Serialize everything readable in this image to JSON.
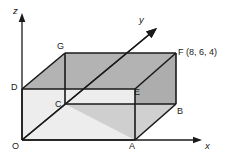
{
  "figure": {
    "background_color": "#ffffff",
    "line_color": "#1a1a1a",
    "axes": {
      "x_label": "x",
      "y_label": "y",
      "z_label": "z",
      "origin_label": "O"
    },
    "vertices": [
      {
        "key": "O",
        "label": "O",
        "coords": null
      },
      {
        "key": "A",
        "label": "A",
        "coords": null
      },
      {
        "key": "B",
        "label": "B",
        "coords": null
      },
      {
        "key": "C",
        "label": "C",
        "coords": null
      },
      {
        "key": "D",
        "label": "D",
        "coords": null
      },
      {
        "key": "E",
        "label": "E",
        "coords": null
      },
      {
        "key": "G",
        "label": "G",
        "coords": null
      },
      {
        "key": "F",
        "label": "F (8, 6, 4)",
        "coords": "(8, 6, 4)"
      }
    ],
    "faces": {
      "front_color": "#ededed",
      "top_color": "#b3b3b3",
      "left_color": "#b5b5b5",
      "right_color": "#b0b0b0",
      "inner_color": "#d4d4d4"
    }
  }
}
